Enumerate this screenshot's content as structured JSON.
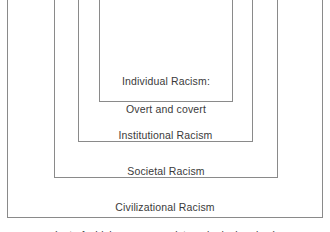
{
  "diagram": {
    "type": "nested-boxes",
    "orientation": "concentric-rectangles",
    "border_color": "#8a8a8a",
    "text_color": "#3a3a3a",
    "background_color": "#ffffff",
    "levels": [
      {
        "id": "individual",
        "depth": 1,
        "position": "innermost",
        "lines": [
          "Individual Racism:",
          "Overt and covert"
        ]
      },
      {
        "id": "institutional",
        "depth": 2,
        "position": "second",
        "lines": [
          "Institutional Racism"
        ]
      },
      {
        "id": "societal",
        "depth": 3,
        "position": "third",
        "lines": [
          "Societal Racism"
        ]
      },
      {
        "id": "civilizational",
        "depth": 4,
        "position": "outermost",
        "lines": [
          "Civilizational Racism",
          "(out of which emerges epistemological racism)"
        ]
      }
    ],
    "labels": {
      "individual_line1": "Individual Racism:",
      "individual_line2": "Overt and covert",
      "institutional_line1": "Institutional Racism",
      "societal_line1": "Societal Racism",
      "civilizational_line1": "Civilizational Racism",
      "civilizational_line2": "(out of which emerges epistemological racism)"
    }
  }
}
